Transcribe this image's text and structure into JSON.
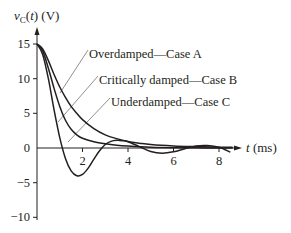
{
  "chart_data": {
    "type": "line",
    "title": "",
    "xlabel": "t (ms)",
    "ylabel": "vC(t) (V)",
    "xlim": [
      0,
      8.6
    ],
    "ylim": [
      -10.5,
      17
    ],
    "grid": false,
    "legend": "inline annotations with leader lines",
    "x_ticks": [
      2,
      4,
      6,
      8
    ],
    "x_tick_labels": [
      "2",
      "4",
      "6",
      "8"
    ],
    "y_ticks": [
      15,
      10,
      5,
      0,
      -5,
      -10
    ],
    "y_tick_labels": [
      "15",
      "10",
      "5",
      "0",
      "−5",
      "−10"
    ],
    "series": [
      {
        "name": "Overdamped—Case A",
        "x": [
          0,
          0.25,
          0.5,
          0.75,
          1.0,
          1.25,
          1.5,
          1.75,
          2.0,
          2.5,
          3.0,
          3.5,
          4.0,
          4.5,
          5.0,
          6.0,
          7.0,
          8.0,
          8.6
        ],
        "values": [
          15,
          14.3,
          12.6,
          10.6,
          8.8,
          7.3,
          6.0,
          5.0,
          4.1,
          2.8,
          1.9,
          1.35,
          0.95,
          0.7,
          0.5,
          0.3,
          0.2,
          0.12,
          0.1
        ]
      },
      {
        "name": "Critically damped—Case B",
        "x": [
          0,
          0.25,
          0.5,
          0.75,
          1.0,
          1.25,
          1.5,
          1.75,
          2.0,
          2.5,
          3.0,
          3.5,
          4.0,
          5.0,
          6.0,
          7.0,
          8.0,
          8.6
        ],
        "values": [
          15,
          14.0,
          11.5,
          8.6,
          6.0,
          4.0,
          2.7,
          1.9,
          1.4,
          0.9,
          0.6,
          0.4,
          0.28,
          0.12,
          0.05,
          0.02,
          0.0,
          0.0
        ]
      },
      {
        "name": "Underdamped—Case C",
        "x": [
          0,
          0.25,
          0.5,
          0.75,
          1.0,
          1.25,
          1.5,
          1.75,
          2.0,
          2.25,
          2.5,
          2.75,
          3.0,
          3.25,
          3.5,
          3.75,
          4.0,
          4.5,
          5.0,
          5.5,
          6.0,
          6.5,
          7.0,
          7.5,
          8.0,
          8.5
        ],
        "values": [
          15,
          13.5,
          10.0,
          5.5,
          1.5,
          -1.5,
          -3.3,
          -4.0,
          -3.8,
          -2.9,
          -1.6,
          -0.4,
          0.5,
          0.95,
          1.1,
          1.05,
          0.9,
          0.2,
          -0.5,
          -0.75,
          -0.55,
          -0.1,
          0.3,
          0.35,
          0.1,
          -0.6
        ]
      }
    ],
    "annotations": [
      {
        "text": "Overdamped—Case A",
        "x_px": 89,
        "y_px": 53
      },
      {
        "text": "Critically damped—Case B",
        "x_px": 99,
        "y_px": 79
      },
      {
        "text": "Underdamped—Case C",
        "x_px": 111,
        "y_px": 101
      }
    ]
  },
  "labels": {
    "ylabel_v": "v",
    "ylabel_sub": "C",
    "ylabel_rest_open": "(",
    "ylabel_t": "t",
    "ylabel_rest_close": ") (V)",
    "xlabel_t": "t",
    "xlabel_units": " (ms)",
    "annotation_a": "Overdamped—Case A",
    "annotation_b": "Critically damped—Case B",
    "annotation_c": "Underdamped—Case C",
    "ytick_15": "15",
    "ytick_10": "10",
    "ytick_5": "5",
    "ytick_0": "0",
    "ytick_m5": "−5",
    "ytick_m10": "−10",
    "xtick_2": "2",
    "xtick_4": "4",
    "xtick_6": "6",
    "xtick_8": "8"
  }
}
